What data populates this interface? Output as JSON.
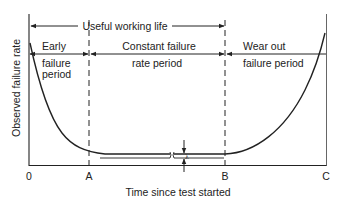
{
  "diagram": {
    "y_axis_label": "Observed failure rate",
    "x_axis_label": "Time since test started",
    "x_ticks": [
      "0",
      "A",
      "B",
      "C"
    ],
    "span_label": "Useful working life",
    "periods": [
      {
        "line1": "Early",
        "line2": "failure",
        "line3": "period"
      },
      {
        "line1": "Constant failure",
        "line2": "rate period"
      },
      {
        "line1": "Wear out",
        "line2": "failure period"
      }
    ],
    "constant_rate_symbol": "λ",
    "ink_color": "#222222"
  }
}
